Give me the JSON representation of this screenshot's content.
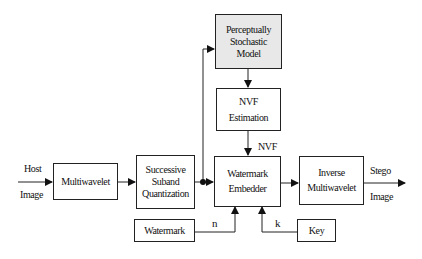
{
  "diagram": {
    "blocks": {
      "multiwavelet": "Multiwavelet",
      "quantization": [
        "Successive",
        "Suband",
        "Quantization"
      ],
      "psm": [
        "Perceptually",
        "Stochastic",
        "Model"
      ],
      "nvf": [
        "NVF",
        "Estimation"
      ],
      "embedder": [
        "Watermark",
        "Embedder"
      ],
      "inverse": [
        "Inverse",
        "Multiwavelet"
      ],
      "watermark": "Watermark",
      "key": "Key"
    },
    "labels": {
      "host": "Host",
      "host_image": "Image",
      "stego": "Stego",
      "stego_image": "Image",
      "nvf": "NVF",
      "n": "n",
      "k": "k"
    },
    "colors": {
      "line": "#222222",
      "shaded_block": "#e8e8e8"
    }
  }
}
